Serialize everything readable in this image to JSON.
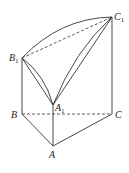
{
  "diagram": {
    "type": "geometry-solid",
    "points": {
      "A": {
        "label": "A",
        "sub": ""
      },
      "B": {
        "label": "B",
        "sub": ""
      },
      "C": {
        "label": "C",
        "sub": ""
      },
      "A1": {
        "label": "A",
        "sub": "1"
      },
      "B1": {
        "label": "B",
        "sub": "1"
      },
      "C1": {
        "label": "C",
        "sub": "1"
      }
    }
  }
}
